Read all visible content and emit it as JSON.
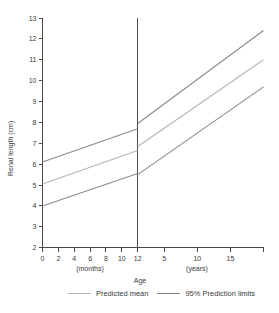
{
  "chart_data": {
    "type": "line",
    "title": "",
    "ylabel": "Renal length (cm)",
    "xlabel": "Age",
    "ylim": [
      2,
      13
    ],
    "y_ticks": [
      2,
      3,
      4,
      5,
      6,
      7,
      8,
      9,
      10,
      11,
      12,
      13
    ],
    "grid": "off",
    "legend_position": "bottom",
    "x_axis": {
      "label": "Age",
      "segments": [
        {
          "unit_label": "(months)",
          "domain": [
            0,
            12
          ],
          "ticks": [
            0,
            2,
            4,
            6,
            8,
            10,
            12
          ]
        },
        {
          "unit_label": "(years)",
          "domain": [
            1,
            20
          ],
          "ticks": [
            5,
            10,
            15
          ]
        }
      ],
      "divider_at": "12 months / 1 year"
    },
    "series": [
      {
        "name": "Predicted mean",
        "color": "#b5b5b5",
        "segments": [
          {
            "x": [
              0,
              12
            ],
            "y": [
              5.05,
              6.65
            ]
          },
          {
            "x": [
              1,
              20
            ],
            "y": [
              6.85,
              11.0
            ]
          }
        ]
      },
      {
        "name": "95% Prediction limits (upper)",
        "color": "#8a8a8a",
        "segments": [
          {
            "x": [
              0,
              12
            ],
            "y": [
              6.1,
              7.7
            ]
          },
          {
            "x": [
              1,
              20
            ],
            "y": [
              7.95,
              12.4
            ]
          }
        ]
      },
      {
        "name": "95% Prediction limits (lower)",
        "color": "#8a8a8a",
        "segments": [
          {
            "x": [
              0,
              12
            ],
            "y": [
              4.0,
              5.55
            ]
          },
          {
            "x": [
              1,
              20
            ],
            "y": [
              5.5,
              9.7
            ]
          }
        ]
      }
    ],
    "legend": [
      {
        "label": "Predicted mean",
        "color": "#b5b5b5"
      },
      {
        "label": "95% Prediction limits",
        "color": "#8a8a8a"
      }
    ]
  },
  "colors": {
    "axis": "#4a4a4a",
    "text": "#3a3a3a",
    "background": "#ffffff"
  }
}
